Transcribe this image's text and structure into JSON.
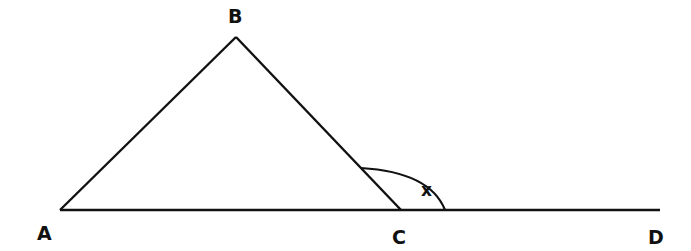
{
  "diagram": {
    "title": "",
    "points": {
      "A": {
        "label": "A",
        "x": 60,
        "y": 210
      },
      "B": {
        "label": "B",
        "x": 236,
        "y": 37
      },
      "C": {
        "label": "C",
        "x": 401,
        "y": 210
      },
      "D": {
        "label": "D",
        "x": 660,
        "y": 210
      }
    },
    "segments": [
      "AB",
      "BC",
      "AD"
    ],
    "angle": {
      "label": "x",
      "vertex": "C",
      "between": [
        "CB",
        "CD"
      ]
    },
    "colors": {
      "stroke": "#111111",
      "background": "#ffffff"
    }
  }
}
